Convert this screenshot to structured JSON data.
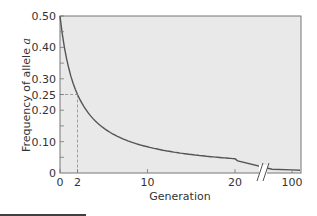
{
  "chart_data": {
    "type": "line",
    "title": "",
    "xlabel": "Generation",
    "ylabel": "Frequency of allele a",
    "ylim": [
      0,
      0.5
    ],
    "xlim": [
      0,
      100
    ],
    "x_ticks": [
      "0",
      "2",
      "10",
      "20",
      "100"
    ],
    "y_ticks": [
      "0",
      "0.10",
      "0.20",
      "0.25",
      "0.30",
      "0.40",
      "0.50"
    ],
    "axis_break": "between 20 and 100 on x-axis",
    "annotation": "dashed guide lines at generation 2, frequency 0.25",
    "series": [
      {
        "name": "q_t = q0/(1 + t*q0)",
        "x": [
          0,
          1,
          2,
          3,
          4,
          5,
          6,
          8,
          10,
          12,
          15,
          20,
          25,
          100
        ],
        "values": [
          0.5,
          0.333,
          0.25,
          0.2,
          0.167,
          0.143,
          0.125,
          0.1,
          0.083,
          0.071,
          0.059,
          0.045,
          0.037,
          0.01
        ]
      }
    ],
    "grid": false,
    "colors": {
      "plot_bg": "#e9e9e9",
      "curve": "#555555",
      "guide": "#888888"
    }
  },
  "labels": {
    "xlabel": "Generation",
    "ylabel_prefix": "Frequency of allele ",
    "ylabel_italic": "a"
  }
}
